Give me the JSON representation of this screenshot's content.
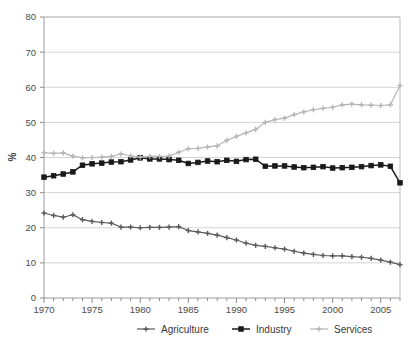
{
  "chart_data": {
    "type": "line",
    "title": "",
    "subtitle": "",
    "xlabel": "",
    "ylabel": "%",
    "xlim": [
      1970,
      2007
    ],
    "ylim": [
      0,
      80
    ],
    "ytick_step": 10,
    "yticks": [
      "0",
      "10",
      "20",
      "30",
      "40",
      "50",
      "60",
      "70",
      "80"
    ],
    "xticks": [
      "1970",
      "1975",
      "1980",
      "1985",
      "1990",
      "1995",
      "2000",
      "2005"
    ],
    "grid": "horizontal",
    "legend_position": "bottom",
    "x": [
      1970,
      1971,
      1972,
      1973,
      1974,
      1975,
      1976,
      1977,
      1978,
      1979,
      1980,
      1981,
      1982,
      1983,
      1984,
      1985,
      1986,
      1987,
      1988,
      1989,
      1990,
      1991,
      1992,
      1993,
      1994,
      1995,
      1996,
      1997,
      1998,
      1999,
      2000,
      2001,
      2002,
      2003,
      2004,
      2005,
      2006,
      2007
    ],
    "series": [
      {
        "name": "Agriculture",
        "color": "#5a5a5a",
        "marker": "cross",
        "values": [
          24.2,
          23.5,
          23.0,
          23.7,
          22.3,
          21.8,
          21.5,
          21.3,
          20.2,
          20.2,
          20.0,
          20.1,
          20.1,
          20.2,
          20.3,
          19.2,
          18.8,
          18.4,
          17.9,
          17.2,
          16.5,
          15.6,
          15.0,
          14.7,
          14.3,
          13.9,
          13.3,
          12.8,
          12.4,
          12.1,
          12.0,
          12.0,
          11.8,
          11.6,
          11.3,
          10.8,
          10.2,
          9.5
        ]
      },
      {
        "name": "Industry",
        "color": "#1a1a1a",
        "marker": "square",
        "values": [
          34.4,
          34.8,
          35.3,
          35.9,
          37.8,
          38.2,
          38.4,
          38.7,
          38.8,
          39.3,
          39.9,
          39.6,
          39.6,
          39.4,
          39.2,
          38.3,
          38.6,
          39.0,
          38.8,
          39.2,
          38.9,
          39.4,
          39.5,
          37.5,
          37.6,
          37.6,
          37.3,
          37.1,
          37.2,
          37.4,
          37.0,
          37.1,
          37.2,
          37.4,
          37.7,
          37.9,
          37.5,
          32.8
        ]
      },
      {
        "name": "Services",
        "color": "#b5b5b5",
        "marker": "cross",
        "values": [
          41.4,
          41.2,
          41.3,
          40.4,
          39.9,
          40.0,
          40.1,
          40.3,
          41.0,
          40.5,
          40.1,
          40.3,
          40.3,
          40.4,
          41.5,
          42.5,
          42.6,
          43.0,
          43.3,
          44.9,
          46.0,
          47.0,
          48.0,
          50.0,
          50.8,
          51.2,
          52.2,
          53.0,
          53.6,
          54.0,
          54.3,
          55.0,
          55.2,
          55.0,
          54.9,
          54.8,
          55.0,
          60.5
        ]
      }
    ]
  },
  "legend": {
    "items": [
      {
        "label": "Agriculture"
      },
      {
        "label": "Industry"
      },
      {
        "label": "Services"
      }
    ]
  }
}
